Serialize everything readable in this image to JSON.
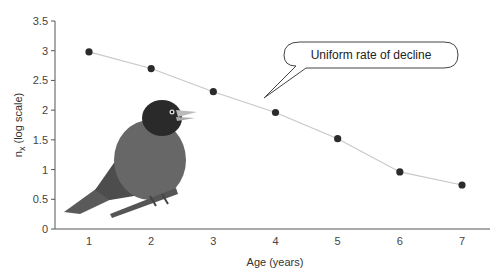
{
  "chart_data": {
    "type": "line",
    "title": "",
    "xlabel": "Age (years)",
    "ylabel": "n_x (log scale)",
    "ylabel_main": "n",
    "ylabel_sub": "x",
    "ylabel_rest": " (log scale)",
    "x": [
      1,
      2,
      3,
      4,
      5,
      6,
      7
    ],
    "categories": [
      "1",
      "2",
      "3",
      "4",
      "5",
      "6",
      "7"
    ],
    "series": [
      {
        "name": "n_x",
        "values": [
          2.98,
          2.7,
          2.31,
          1.96,
          1.52,
          0.96,
          0.74
        ]
      }
    ],
    "yticks": [
      "0",
      "0.5",
      "1",
      "1.5",
      "2",
      "2.5",
      "3",
      "3.5"
    ],
    "ylim": [
      0,
      3.5
    ],
    "xlim": [
      0.5,
      7.4
    ],
    "grid": false,
    "legend": null,
    "annotations": [
      {
        "text": "Uniform rate of decline",
        "points_to_x": 3.8,
        "points_to_y": 2.1
      }
    ],
    "illustration": "bird-perched-on-branch"
  },
  "colors": {
    "line": "#c8c8c8",
    "marker": "#2b2b2b",
    "axis": "#555555"
  }
}
